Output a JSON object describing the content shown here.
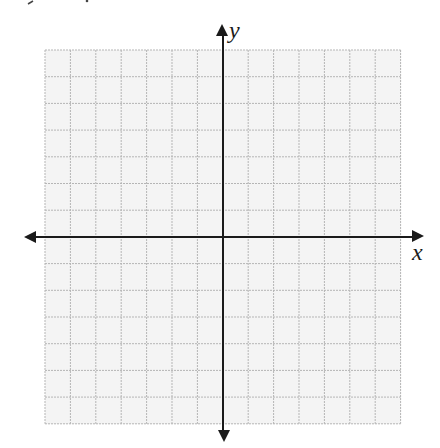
{
  "diagram": {
    "type": "coordinate-plane",
    "x_axis_label": "x",
    "y_axis_label": "y",
    "grid": {
      "columns": 14,
      "rows": 14,
      "left": 45,
      "top": 50,
      "cell_width": 25.4,
      "cell_height": 26.7,
      "origin_x": 223,
      "origin_y": 237,
      "background": "#f4f4f4",
      "line_color": "#b5b5b5",
      "line_style": "dashed"
    },
    "axes": {
      "color": "#1a1a1a",
      "x_from": 24,
      "x_to": 424,
      "y_from": 24,
      "y_to": 442
    }
  }
}
